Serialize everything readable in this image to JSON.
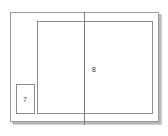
{
  "diagram": {
    "type": "page-layout",
    "regions": [
      {
        "id": "small-region",
        "label": "7"
      },
      {
        "id": "main-region",
        "label": "8"
      }
    ],
    "colors": {
      "line": "#8c8c8c",
      "spine": "#7a7a7a",
      "shadow": "#b8b8b8",
      "background": "#ffffff"
    }
  }
}
